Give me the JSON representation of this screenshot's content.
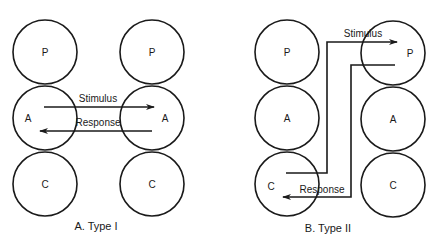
{
  "diagram": {
    "panel_a": {
      "caption": "A. Type I",
      "left_column": {
        "nodes": [
          "P",
          "A",
          "C"
        ]
      },
      "right_column": {
        "nodes": [
          "P",
          "A",
          "C"
        ]
      },
      "arrows": [
        {
          "label": "Stimulus",
          "from": "left.A",
          "to": "right.A"
        },
        {
          "label": "Response",
          "from": "right.A",
          "to": "left.A"
        }
      ]
    },
    "panel_b": {
      "caption": "B. Type II",
      "left_column": {
        "nodes": [
          "P",
          "A",
          "C"
        ]
      },
      "right_column": {
        "nodes": [
          "P",
          "A",
          "C"
        ]
      },
      "arrows": [
        {
          "label": "Stimulus",
          "from": "left.C",
          "to": "right.P"
        },
        {
          "label": "Response",
          "from": "right.P",
          "to": "left.C"
        }
      ]
    },
    "colors": {
      "stroke": "#1a1a1a",
      "background": "#ffffff"
    }
  }
}
